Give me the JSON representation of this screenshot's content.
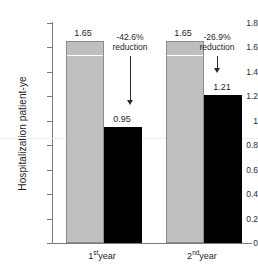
{
  "chart_data": {
    "type": "bar",
    "title": "",
    "subtitle": "",
    "xlabel": "",
    "ylabel": "Hospitalization patient-ye",
    "ylim": [
      0,
      1.8
    ],
    "ytick_labels": [
      "1.8",
      "1.6",
      "1.4",
      "1.2",
      "1",
      "0.8",
      "0.6",
      "0.4",
      "0.2",
      "0"
    ],
    "ytick_values": [
      1.8,
      1.6,
      1.4,
      1.2,
      1.0,
      0.8,
      0.6,
      0.4,
      0.2,
      0
    ],
    "grid": false,
    "legend": "none",
    "categories": [
      "1st year",
      "2nd year"
    ],
    "category_parts": [
      {
        "num": "1",
        "sup": "st",
        "unit": "year"
      },
      {
        "num": "2",
        "sup": "nd",
        "unit": "year"
      }
    ],
    "series": [
      {
        "name": "gray",
        "color": "#bfbfbf",
        "values": [
          1.65,
          1.65
        ],
        "value_labels": [
          "1.65",
          "1.65"
        ]
      },
      {
        "name": "black",
        "color": "#000000",
        "values": [
          0.95,
          1.21
        ],
        "value_labels": [
          "0.95",
          "1.21"
        ]
      }
    ],
    "annotations": [
      {
        "text_line1": "-42.6%",
        "text_line2": "reduction",
        "group": "1st year"
      },
      {
        "text_line1": "-26.9%",
        "text_line2": "reduction",
        "group": "2nd year"
      }
    ],
    "reference_line": {
      "value": 0.86,
      "color": "#ededed"
    },
    "bar_inner_line": {
      "value": 1.55,
      "color": "#ffffff"
    }
  },
  "colors": {
    "axis": "#7a7a7a",
    "text": "#1e1e1e",
    "gray_bar": "#bfbfbf",
    "gray_bar_border": "#8c8c8c",
    "black_bar": "#000000",
    "background": "#ffffff"
  }
}
